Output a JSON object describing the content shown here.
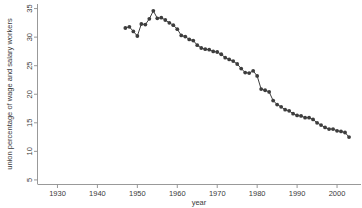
{
  "chart_data": {
    "type": "line",
    "title": "",
    "subtitle": "",
    "xlabel": "year",
    "ylabel": "union percentage of wage and salary workers",
    "xlim": [
      1925,
      2006
    ],
    "ylim": [
      4.2,
      35.8
    ],
    "xticks": [
      1930,
      1940,
      1950,
      1960,
      1970,
      1980,
      1990,
      2000
    ],
    "yticks": [
      5,
      10,
      15,
      20,
      25,
      30,
      35
    ],
    "grid": false,
    "legend": null,
    "marker": "filled-circle",
    "line_color": "#3f3f3f",
    "marker_color": "#3d3d3d",
    "axis_color": "#8d8d8d",
    "background_color": "#ffffff",
    "x": [
      1947,
      1948,
      1949,
      1950,
      1951,
      1952,
      1953,
      1954,
      1955,
      1956,
      1957,
      1958,
      1959,
      1960,
      1961,
      1962,
      1963,
      1964,
      1965,
      1966,
      1967,
      1968,
      1969,
      1970,
      1971,
      1972,
      1973,
      1974,
      1975,
      1976,
      1977,
      1978,
      1979,
      1980,
      1981,
      1982,
      1983,
      1984,
      1985,
      1986,
      1987,
      1988,
      1989,
      1990,
      1991,
      1992,
      1993,
      1994,
      1995,
      1996,
      1997,
      1998,
      1999,
      2000,
      2001,
      2002,
      2003
    ],
    "y": [
      31.6,
      31.8,
      31.0,
      30.2,
      32.3,
      32.2,
      33.2,
      34.6,
      33.3,
      33.4,
      33.0,
      32.5,
      32.1,
      31.4,
      30.3,
      30.1,
      29.6,
      29.4,
      28.6,
      28.1,
      27.9,
      27.8,
      27.5,
      27.4,
      27.0,
      26.4,
      26.1,
      25.8,
      25.3,
      24.5,
      23.8,
      23.7,
      24.1,
      23.2,
      20.9,
      20.7,
      20.4,
      18.9,
      18.2,
      17.8,
      17.3,
      17.1,
      16.6,
      16.3,
      16.2,
      15.9,
      15.9,
      15.6,
      15.0,
      14.6,
      14.2,
      13.9,
      13.9,
      13.6,
      13.5,
      13.3,
      12.5
    ],
    "series": [
      {
        "name": "union percentage",
        "values": [
          31.6,
          31.8,
          31.0,
          30.2,
          32.3,
          32.2,
          33.2,
          34.6,
          33.3,
          33.4,
          33.0,
          32.5,
          32.1,
          31.4,
          30.3,
          30.1,
          29.6,
          29.4,
          28.6,
          28.1,
          27.9,
          27.8,
          27.5,
          27.4,
          27.0,
          26.4,
          26.1,
          25.8,
          25.3,
          24.5,
          23.8,
          23.7,
          24.1,
          23.2,
          20.9,
          20.7,
          20.4,
          18.9,
          18.2,
          17.8,
          17.3,
          17.1,
          16.6,
          16.3,
          16.2,
          15.9,
          15.9,
          15.6,
          15.0,
          14.6,
          14.2,
          13.9,
          13.9,
          13.6,
          13.5,
          13.3,
          12.5
        ]
      }
    ]
  }
}
